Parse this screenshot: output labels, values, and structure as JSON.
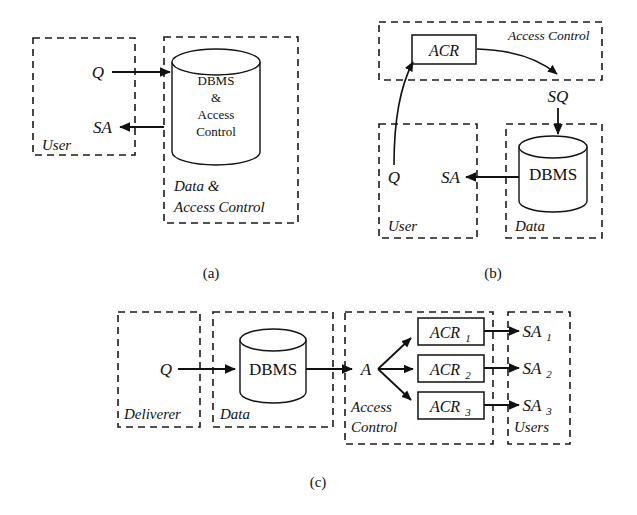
{
  "figure": {
    "colors": {
      "stroke": "#111111",
      "dash_stroke": "#1a1a1a",
      "background": "#ffffff"
    },
    "panels": [
      {
        "id": "a",
        "caption": "(a)",
        "zones": [
          {
            "name": "user",
            "label": "User"
          },
          {
            "name": "data-and-access-control",
            "label_line1": "Data &",
            "label_line2": "Access Control"
          }
        ],
        "nodes": [
          {
            "name": "dbms-access-control-cylinder",
            "shape": "cylinder",
            "lines": [
              "DBMS",
              "&",
              "Access",
              "Control"
            ]
          }
        ],
        "flows": [
          {
            "name": "query-flow",
            "label": "Q",
            "direction": "user-to-store"
          },
          {
            "name": "answer-flow",
            "label": "SA",
            "direction": "store-to-user"
          }
        ]
      },
      {
        "id": "b",
        "caption": "(b)",
        "zones": [
          {
            "name": "access-control",
            "label": "Access Control"
          },
          {
            "name": "user",
            "label": "User"
          },
          {
            "name": "data",
            "label": "Data"
          }
        ],
        "nodes": [
          {
            "name": "acr-box",
            "shape": "rect",
            "label": "ACR"
          },
          {
            "name": "dbms-cylinder",
            "shape": "cylinder",
            "label": "DBMS"
          }
        ],
        "flows": [
          {
            "name": "query-flow",
            "label": "Q",
            "direction": "user-to-acr"
          },
          {
            "name": "safe-query-flow",
            "label": "SQ",
            "direction": "acr-to-dbms"
          },
          {
            "name": "answer-flow",
            "label": "SA",
            "direction": "dbms-to-user"
          }
        ]
      },
      {
        "id": "c",
        "caption": "(c)",
        "zones": [
          {
            "name": "deliverer",
            "label": "Deliverer"
          },
          {
            "name": "data",
            "label": "Data"
          },
          {
            "name": "access-control",
            "label_line1": "Access",
            "label_line2": "Control"
          },
          {
            "name": "users",
            "label": "Users"
          }
        ],
        "nodes": [
          {
            "name": "dbms-cylinder",
            "shape": "cylinder",
            "label": "DBMS"
          },
          {
            "name": "acr-1-box",
            "shape": "rect",
            "label": "ACR",
            "subscript": "1"
          },
          {
            "name": "acr-2-box",
            "shape": "rect",
            "label": "ACR",
            "subscript": "2"
          },
          {
            "name": "acr-3-box",
            "shape": "rect",
            "label": "ACR",
            "subscript": "3"
          }
        ],
        "flows": [
          {
            "name": "query-flow",
            "label": "Q",
            "direction": "deliverer-to-dbms"
          },
          {
            "name": "answer-flow",
            "label": "A",
            "direction": "dbms-to-access-control"
          },
          {
            "name": "sa-1-flow",
            "label": "SA",
            "subscript": "1",
            "direction": "acr1-to-user"
          },
          {
            "name": "sa-2-flow",
            "label": "SA",
            "subscript": "2",
            "direction": "acr2-to-user"
          },
          {
            "name": "sa-3-flow",
            "label": "SA",
            "subscript": "3",
            "direction": "acr3-to-user"
          }
        ]
      }
    ]
  }
}
